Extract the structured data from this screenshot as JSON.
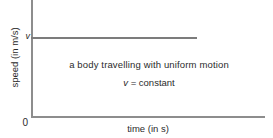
{
  "chart_data": {
    "type": "line",
    "title": "",
    "subtitle": "",
    "xlabel": "time (in s)",
    "ylabel": "speed (in m/s)",
    "x": [
      0,
      1
    ],
    "series": [
      {
        "name": "v = constant",
        "values": [
          1,
          1
        ]
      }
    ],
    "y_tick_labels": [
      "0",
      "v"
    ],
    "x_tick_labels": [
      "0"
    ],
    "origin_label": "0",
    "grid": false,
    "legend": "none",
    "annotations": [
      "a body travelling with uniform motion",
      "v = constant"
    ],
    "line_color": "#7c7c7c",
    "axis_color": "#8d8d8d",
    "text_color": "#2b2b2b",
    "background_color": "#ffffff"
  },
  "figure": {
    "axis_y_label": "speed (in m/s)",
    "axis_x_label": "time (in s)",
    "tick_v_label": "v",
    "origin_label": "0",
    "annotation_line1": "a body travelling with uniform motion",
    "annotation_line2_var": "v",
    "annotation_line2_rest": "= constant"
  }
}
